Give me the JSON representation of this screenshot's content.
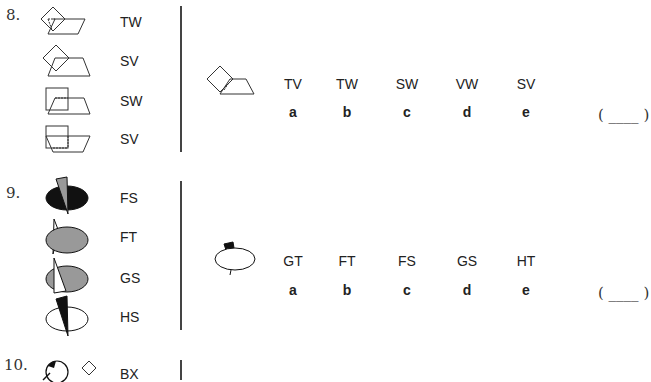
{
  "questions": [
    {
      "number": "8.",
      "examples": [
        {
          "figure": "diamond-over-parallelogram-dashed",
          "code": "TW"
        },
        {
          "figure": "diamond-over-trapezoid-dashed",
          "code": "SV"
        },
        {
          "figure": "square-over-parallelogram-dashed",
          "code": "SW"
        },
        {
          "figure": "square-over-inverted-trapezoid-dashed",
          "code": "SV"
        }
      ],
      "test_figure": "diamond-with-trapezoid",
      "options": [
        {
          "text": "TV",
          "letter": "a"
        },
        {
          "text": "TW",
          "letter": "b"
        },
        {
          "text": "SW",
          "letter": "c"
        },
        {
          "text": "VW",
          "letter": "d"
        },
        {
          "text": "SV",
          "letter": "e"
        }
      ],
      "answer_blank": "( ____ )"
    },
    {
      "number": "9.",
      "examples": [
        {
          "figure": "black-ellipse-grey-triangle",
          "code": "FS"
        },
        {
          "figure": "grey-ellipse-white-triangle-behind",
          "code": "FT"
        },
        {
          "figure": "grey-ellipse-white-triangle-front",
          "code": "GS"
        },
        {
          "figure": "white-ellipse-black-triangle",
          "code": "HS"
        }
      ],
      "test_figure": "white-ellipse-black-trapezoid",
      "options": [
        {
          "text": "GT",
          "letter": "a"
        },
        {
          "text": "FT",
          "letter": "b"
        },
        {
          "text": "FS",
          "letter": "c"
        },
        {
          "text": "GS",
          "letter": "d"
        },
        {
          "text": "HT",
          "letter": "e"
        }
      ],
      "answer_blank": "( ____ )"
    },
    {
      "number": "10.",
      "examples": [
        {
          "figure": "circle-and-diamond",
          "code": "BX"
        }
      ]
    }
  ]
}
